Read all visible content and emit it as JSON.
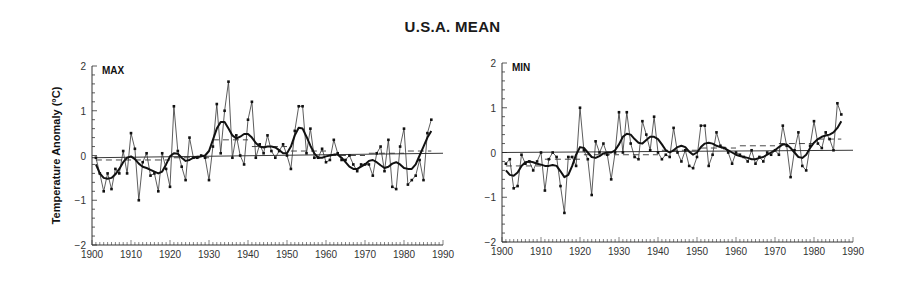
{
  "title": "U.S.A. MEAN",
  "chart_data": [
    {
      "type": "line",
      "panel": "MAX",
      "title": "MAX",
      "xlabel": "",
      "ylabel": "Temperature Anomaly (°C)",
      "xlim": [
        1900,
        1990
      ],
      "ylim": [
        -2,
        2
      ],
      "xticks": [
        1900,
        1910,
        1920,
        1930,
        1940,
        1950,
        1960,
        1970,
        1980,
        1990
      ],
      "yticks": [
        -2,
        -1,
        0,
        1,
        2
      ],
      "grid": false,
      "x": [
        1901,
        1902,
        1903,
        1904,
        1905,
        1906,
        1907,
        1908,
        1909,
        1910,
        1911,
        1912,
        1913,
        1914,
        1915,
        1916,
        1917,
        1918,
        1919,
        1920,
        1921,
        1922,
        1923,
        1924,
        1925,
        1926,
        1927,
        1928,
        1929,
        1930,
        1931,
        1932,
        1933,
        1934,
        1935,
        1936,
        1937,
        1938,
        1939,
        1940,
        1941,
        1942,
        1943,
        1944,
        1945,
        1946,
        1947,
        1948,
        1949,
        1950,
        1951,
        1952,
        1953,
        1954,
        1955,
        1956,
        1957,
        1958,
        1959,
        1960,
        1961,
        1962,
        1963,
        1964,
        1965,
        1966,
        1967,
        1968,
        1969,
        1970,
        1971,
        1972,
        1973,
        1974,
        1975,
        1976,
        1977,
        1978,
        1979,
        1980,
        1981,
        1982,
        1983,
        1984,
        1985,
        1986,
        1987
      ],
      "series": [
        {
          "name": "Annual anomaly",
          "style": "thin line with dots",
          "values": [
            -0.05,
            -0.4,
            -0.8,
            -0.4,
            -0.75,
            -0.3,
            -0.4,
            0.1,
            -0.4,
            0.5,
            0.15,
            -1.0,
            -0.15,
            0.05,
            -0.45,
            -0.4,
            -0.8,
            0.05,
            -0.3,
            -0.7,
            1.1,
            0.1,
            -0.25,
            -0.55,
            0.4,
            -0.05,
            -0.05,
            0.0,
            -0.05,
            -0.55,
            0.2,
            1.15,
            0.05,
            1.0,
            1.65,
            -0.05,
            0.45,
            0.0,
            -0.2,
            0.8,
            1.2,
            -0.05,
            0.25,
            0.05,
            0.45,
            0.1,
            -0.05,
            0.1,
            0.25,
            0.0,
            -0.3,
            0.55,
            1.1,
            1.1,
            0.05,
            0.6,
            -0.05,
            -0.05,
            0.15,
            -0.15,
            -0.1,
            0.35,
            0.05,
            -0.1,
            -0.1,
            0.0,
            -0.2,
            -0.35,
            -0.2,
            -0.2,
            -0.2,
            -0.45,
            0.05,
            0.2,
            -0.35,
            0.35,
            -0.7,
            -0.75,
            0.2,
            0.6,
            -0.65,
            -0.55,
            -0.45,
            -0.1,
            -0.55,
            0.5,
            0.8
          ]
        },
        {
          "name": "Smoothed",
          "style": "thick line",
          "values": [
            -0.2,
            -0.4,
            -0.5,
            -0.52,
            -0.5,
            -0.42,
            -0.3,
            -0.15,
            -0.05,
            -0.02,
            -0.08,
            -0.18,
            -0.25,
            -0.28,
            -0.32,
            -0.36,
            -0.4,
            -0.36,
            -0.2,
            -0.02,
            0.05,
            0.04,
            -0.05,
            -0.12,
            -0.1,
            -0.05,
            -0.03,
            -0.02,
            0.0,
            0.1,
            0.35,
            0.6,
            0.75,
            0.75,
            0.6,
            0.45,
            0.38,
            0.42,
            0.48,
            0.48,
            0.4,
            0.28,
            0.2,
            0.18,
            0.2,
            0.2,
            0.18,
            0.12,
            0.05,
            0.05,
            0.2,
            0.45,
            0.62,
            0.6,
            0.42,
            0.22,
            0.05,
            -0.05,
            -0.05,
            -0.02,
            0.0,
            0.02,
            0.02,
            -0.05,
            -0.15,
            -0.25,
            -0.3,
            -0.3,
            -0.25,
            -0.2,
            -0.12,
            -0.1,
            -0.15,
            -0.22,
            -0.28,
            -0.25,
            -0.18,
            -0.15,
            -0.2,
            -0.28,
            -0.3,
            -0.3,
            -0.2,
            0.0,
            0.2,
            0.4,
            0.55
          ]
        },
        {
          "name": "Decadal mean",
          "style": "dashed segments",
          "segments": [
            {
              "x0": 1901,
              "x1": 1910,
              "y": -0.1
            },
            {
              "x0": 1911,
              "x1": 1920,
              "y": -0.1
            },
            {
              "x0": 1921,
              "x1": 1930,
              "y": -0.05
            },
            {
              "x0": 1931,
              "x1": 1940,
              "y": 0.35
            },
            {
              "x0": 1941,
              "x1": 1950,
              "y": 0.2
            },
            {
              "x0": 1951,
              "x1": 1960,
              "y": 0.1
            },
            {
              "x0": 1961,
              "x1": 1970,
              "y": 0.0
            },
            {
              "x0": 1971,
              "x1": 1980,
              "y": 0.05
            },
            {
              "x0": 1981,
              "x1": 1987,
              "y": 0.1
            }
          ]
        },
        {
          "name": "Linear trend",
          "style": "thin straight line",
          "values_at": {
            "1900": -0.05,
            "1990": 0.05
          }
        }
      ]
    },
    {
      "type": "line",
      "panel": "MIN",
      "title": "MIN",
      "xlabel": "",
      "ylabel": "",
      "xlim": [
        1900,
        1990
      ],
      "ylim": [
        -2,
        2
      ],
      "xticks": [
        1900,
        1910,
        1920,
        1930,
        1940,
        1950,
        1960,
        1970,
        1980,
        1990
      ],
      "yticks": [
        -2,
        -1,
        0,
        1,
        2
      ],
      "grid": false,
      "x": [
        1901,
        1902,
        1903,
        1904,
        1905,
        1906,
        1907,
        1908,
        1909,
        1910,
        1911,
        1912,
        1913,
        1914,
        1915,
        1916,
        1917,
        1918,
        1919,
        1920,
        1921,
        1922,
        1923,
        1924,
        1925,
        1926,
        1927,
        1928,
        1929,
        1930,
        1931,
        1932,
        1933,
        1934,
        1935,
        1936,
        1937,
        1938,
        1939,
        1940,
        1941,
        1942,
        1943,
        1944,
        1945,
        1946,
        1947,
        1948,
        1949,
        1950,
        1951,
        1952,
        1953,
        1954,
        1955,
        1956,
        1957,
        1958,
        1959,
        1960,
        1961,
        1962,
        1963,
        1964,
        1965,
        1966,
        1967,
        1968,
        1969,
        1970,
        1971,
        1972,
        1973,
        1974,
        1975,
        1976,
        1977,
        1978,
        1979,
        1980,
        1981,
        1982,
        1983,
        1984,
        1985,
        1986,
        1987
      ],
      "series": [
        {
          "name": "Annual anomaly",
          "style": "thin line with dots",
          "values": [
            -0.25,
            -0.15,
            -0.8,
            -0.75,
            -0.05,
            -0.25,
            -0.2,
            -0.4,
            -0.2,
            0.0,
            -0.85,
            -0.15,
            0.0,
            -0.1,
            -0.75,
            -1.35,
            -0.1,
            -0.1,
            -0.3,
            1.0,
            0.05,
            -0.15,
            -0.95,
            0.25,
            0.0,
            0.2,
            -0.05,
            -0.6,
            0.0,
            0.9,
            0.0,
            0.9,
            0.2,
            -0.1,
            -0.15,
            0.7,
            0.4,
            0.05,
            0.8,
            0.0,
            -0.15,
            -0.05,
            -0.1,
            0.55,
            0.0,
            -0.2,
            0.05,
            -0.3,
            -0.35,
            -0.1,
            0.6,
            0.6,
            -0.3,
            -0.05,
            0.45,
            0.15,
            0.1,
            0.0,
            -0.25,
            0.0,
            -0.05,
            -0.1,
            -0.2,
            0.05,
            -0.25,
            -0.1,
            -0.2,
            0.0,
            -0.05,
            0.05,
            -0.05,
            0.6,
            0.15,
            -0.55,
            0.05,
            0.45,
            -0.3,
            -0.4,
            0.15,
            0.7,
            0.2,
            0.1,
            0.45,
            0.3,
            0.05,
            1.1,
            0.85
          ]
        },
        {
          "name": "Smoothed",
          "style": "thick line",
          "values": [
            -0.4,
            -0.5,
            -0.52,
            -0.45,
            -0.3,
            -0.22,
            -0.2,
            -0.22,
            -0.25,
            -0.27,
            -0.3,
            -0.3,
            -0.28,
            -0.3,
            -0.42,
            -0.55,
            -0.5,
            -0.3,
            -0.05,
            0.12,
            0.1,
            0.0,
            -0.1,
            -0.12,
            -0.08,
            -0.02,
            0.0,
            0.0,
            0.05,
            0.18,
            0.35,
            0.42,
            0.4,
            0.3,
            0.22,
            0.2,
            0.28,
            0.35,
            0.35,
            0.3,
            0.18,
            0.05,
            0.0,
            0.05,
            0.12,
            0.15,
            0.12,
            0.02,
            -0.05,
            0.0,
            0.12,
            0.2,
            0.22,
            0.2,
            0.15,
            0.12,
            0.1,
            0.05,
            0.0,
            -0.05,
            -0.08,
            -0.1,
            -0.12,
            -0.15,
            -0.15,
            -0.12,
            -0.1,
            -0.05,
            0.0,
            0.05,
            0.12,
            0.18,
            0.18,
            0.1,
            0.0,
            -0.1,
            -0.12,
            -0.05,
            0.1,
            0.22,
            0.3,
            0.35,
            0.38,
            0.4,
            0.45,
            0.55,
            0.7
          ]
        },
        {
          "name": "Decadal mean",
          "style": "dashed segments",
          "segments": [
            {
              "x0": 1901,
              "x1": 1910,
              "y": -0.3
            },
            {
              "x0": 1911,
              "x1": 1920,
              "y": -0.15
            },
            {
              "x0": 1921,
              "x1": 1930,
              "y": -0.05
            },
            {
              "x0": 1931,
              "x1": 1940,
              "y": -0.05
            },
            {
              "x0": 1941,
              "x1": 1950,
              "y": 0.05
            },
            {
              "x0": 1951,
              "x1": 1960,
              "y": 0.1
            },
            {
              "x0": 1961,
              "x1": 1970,
              "y": 0.15
            },
            {
              "x0": 1971,
              "x1": 1980,
              "y": 0.2
            },
            {
              "x0": 1981,
              "x1": 1987,
              "y": 0.3
            }
          ]
        },
        {
          "name": "Linear trend",
          "style": "thin straight line",
          "values_at": {
            "1900": 0.0,
            "1990": 0.05
          }
        }
      ]
    }
  ]
}
